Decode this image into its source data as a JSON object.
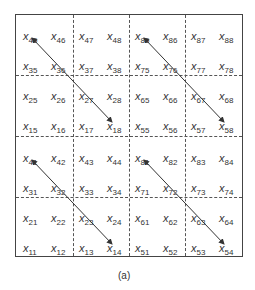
{
  "caption": "(a)",
  "variable_symbol": "x",
  "rows": [
    [
      "45",
      "46",
      "47",
      "48",
      "85",
      "86",
      "87",
      "88"
    ],
    [
      "35",
      "36",
      "37",
      "38",
      "75",
      "76",
      "77",
      "78"
    ],
    [
      "25",
      "26",
      "27",
      "28",
      "65",
      "66",
      "67",
      "68"
    ],
    [
      "15",
      "16",
      "17",
      "18",
      "55",
      "56",
      "57",
      "58"
    ],
    [
      "41",
      "42",
      "43",
      "44",
      "81",
      "82",
      "83",
      "84"
    ],
    [
      "31",
      "32",
      "33",
      "34",
      "71",
      "72",
      "73",
      "74"
    ],
    [
      "21",
      "22",
      "23",
      "24",
      "61",
      "62",
      "63",
      "64"
    ],
    [
      "11",
      "12",
      "13",
      "14",
      "51",
      "52",
      "53",
      "54"
    ]
  ],
  "arrows": [
    {
      "from": "x45",
      "to": "x18"
    },
    {
      "from": "x85",
      "to": "x58"
    },
    {
      "from": "x41",
      "to": "x14"
    },
    {
      "from": "x81",
      "to": "x54"
    }
  ]
}
